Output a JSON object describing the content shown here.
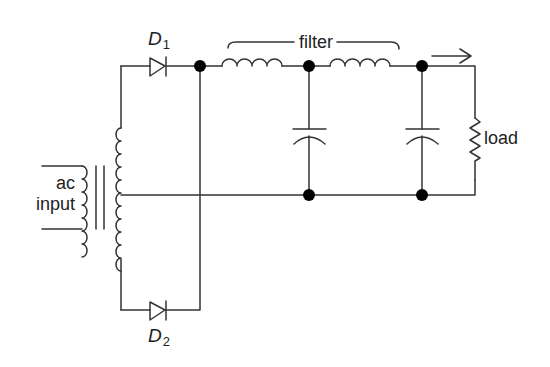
{
  "diagram": {
    "type": "full-wave rectifier with LC filter",
    "labels": {
      "d1_letter": "D",
      "d1_sub": "1",
      "d2_letter": "D",
      "d2_sub": "2",
      "filter": "filter",
      "load": "load",
      "ac_line1": "ac",
      "ac_line2": "input"
    },
    "components": [
      {
        "id": "T1",
        "kind": "center-tapped transformer",
        "label": "ac input"
      },
      {
        "id": "D1",
        "kind": "diode"
      },
      {
        "id": "D2",
        "kind": "diode"
      },
      {
        "id": "L1",
        "kind": "inductor"
      },
      {
        "id": "L2",
        "kind": "inductor"
      },
      {
        "id": "C1",
        "kind": "capacitor"
      },
      {
        "id": "C2",
        "kind": "capacitor"
      },
      {
        "id": "RL",
        "kind": "resistor",
        "label": "load"
      }
    ],
    "colors": {
      "line": "#333333",
      "node": "#000000",
      "background": "#ffffff"
    }
  }
}
